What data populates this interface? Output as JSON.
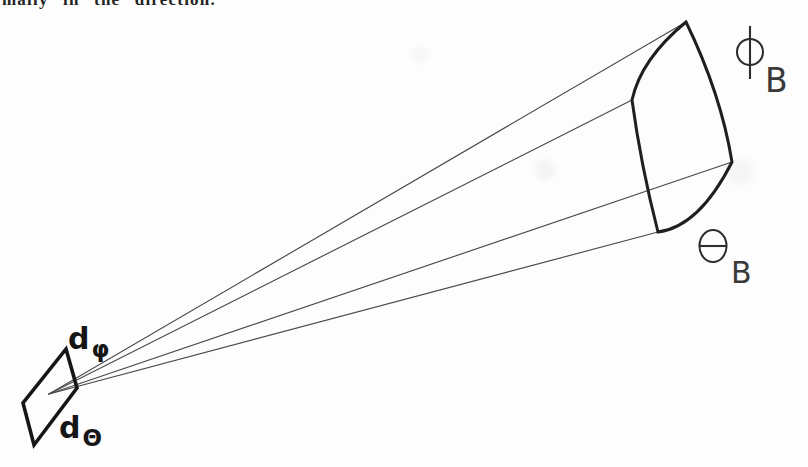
{
  "colors": {
    "paper": "#fdfdfd",
    "ink": "#1f1f1f",
    "thin_line": "#4a4a4a",
    "stencil": "#2e2e2e"
  },
  "top_text": {
    "fragment": "mally in the direction."
  },
  "diagram": {
    "labels": {
      "phi_B": {
        "symbol": "Φ",
        "subscript": "B"
      },
      "theta_B": {
        "symbol": "Θ",
        "subscript": "B"
      },
      "d_phi": {
        "symbol": "d",
        "subscript": "φ"
      },
      "d_theta": {
        "symbol": "d",
        "subscript": "Θ"
      }
    }
  }
}
